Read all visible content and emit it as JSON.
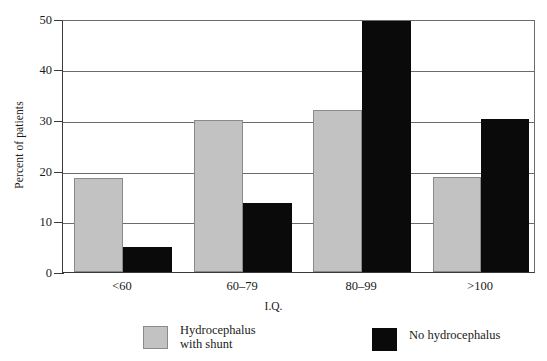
{
  "chart_data": {
    "type": "bar",
    "title": "",
    "subtitle": "",
    "xlabel": "I.Q.",
    "ylabel": "Percent of patients",
    "categories": [
      "<60",
      "60–79",
      "80–99",
      ">100"
    ],
    "series": [
      {
        "name": "Hydrocephalus\nwith shunt",
        "color": "#c2c2c2",
        "values": [
          18.7,
          30.2,
          32.2,
          19.0
        ]
      },
      {
        "name": "No hydrocephalus",
        "color": "#0a0a0a",
        "values": [
          5.0,
          13.8,
          50.0,
          30.4
        ]
      }
    ],
    "ylim": [
      0,
      50
    ],
    "yticks": [
      0,
      10,
      20,
      30,
      40,
      50
    ],
    "ytick_labels": [
      "0",
      "10",
      "20",
      "30",
      "40",
      "50"
    ],
    "grid": "horizontal",
    "legend_position": "bottom"
  },
  "axes": {
    "y_title": "Percent of patients",
    "x_title": "I.Q.",
    "y_ticks": [
      {
        "label": "50",
        "value": 50
      },
      {
        "label": "40",
        "value": 40
      },
      {
        "label": "30",
        "value": 30
      },
      {
        "label": "20",
        "value": 20
      },
      {
        "label": "10",
        "value": 10
      },
      {
        "label": "0",
        "value": 0
      }
    ],
    "x_ticks": [
      {
        "label": "<60"
      },
      {
        "label": "60–79"
      },
      {
        "label": "80–99"
      },
      {
        "label": ">100"
      }
    ]
  },
  "legend": {
    "items": [
      {
        "label": "Hydrocephalus\nwith shunt",
        "color": "#c2c2c2"
      },
      {
        "label": "No hydrocephalus",
        "color": "#0a0a0a"
      }
    ]
  }
}
